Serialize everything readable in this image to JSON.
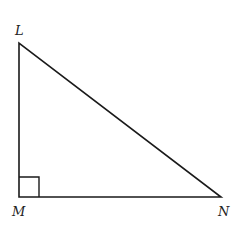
{
  "diagram": {
    "type": "right-triangle",
    "vertices": [
      {
        "name": "L",
        "x": 19,
        "y": 43
      },
      {
        "name": "M",
        "x": 19,
        "y": 197
      },
      {
        "name": "N",
        "x": 221,
        "y": 197
      }
    ],
    "labels": {
      "L": "L",
      "M": "M",
      "N": "N"
    },
    "right_angle_at": "M",
    "stroke_color": "#1a1a1a"
  }
}
